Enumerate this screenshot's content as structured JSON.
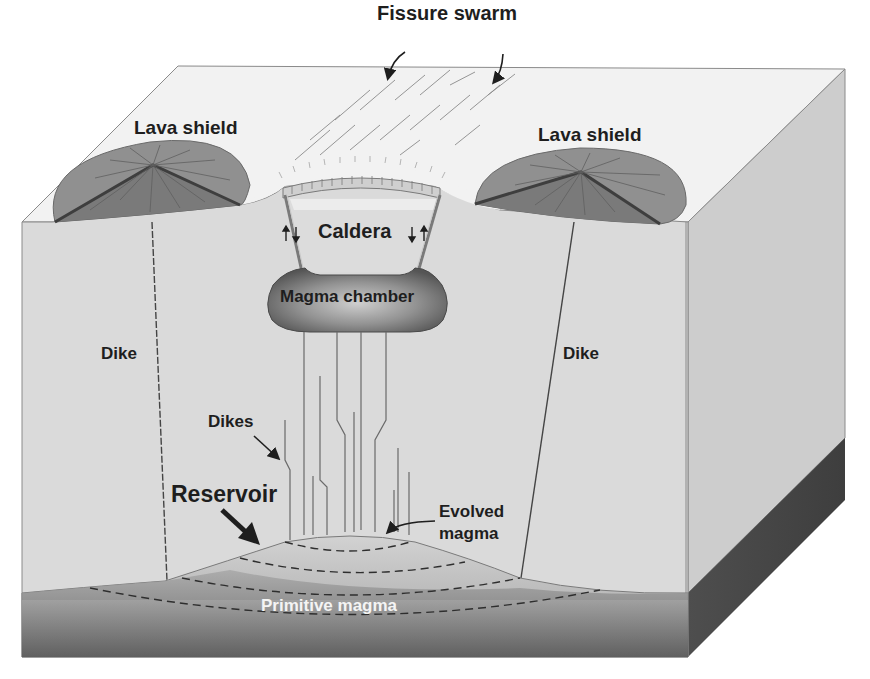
{
  "diagram": {
    "type": "block-diagram",
    "colors": {
      "top_face": "#f3f3f3",
      "front_face": "#dadada",
      "right_face": "#c9c9c9",
      "lava_shield": "#8e8e8e",
      "lava_shield_dark": "#6e6e6e",
      "magma_chamber_outer": "#5a5a5a",
      "magma_chamber_inner": "#c2c2c2",
      "reservoir": "#bdbdbd",
      "primitive_magma_top": "#9a9a9a",
      "primitive_magma_bottom": "#5e5e5e",
      "right_base_side": "#4a4a4a",
      "line": "#555555",
      "text": "#1e1e1e"
    },
    "labels": {
      "fissure_swarm": "Fissure swarm",
      "lava_shield_left": "Lava shield",
      "lava_shield_right": "Lava shield",
      "caldera": "Caldera",
      "magma_chamber": "Magma chamber",
      "dike_left": "Dike",
      "dike_right": "Dike",
      "dikes": "Dikes",
      "reservoir": "Reservoir",
      "evolved_magma_line1": "Evolved",
      "evolved_magma_line2": "magma",
      "primitive_magma": "Primitive magma"
    },
    "arrows": [
      {
        "from": "fissure_swarm",
        "to": "fissure lines (left)"
      },
      {
        "from": "fissure_swarm",
        "to": "fissure lines (right)"
      },
      {
        "from": "dikes",
        "to": "dike swarm"
      },
      {
        "from": "reservoir",
        "to": "reservoir top"
      },
      {
        "from": "evolved_magma",
        "to": "reservoir apex"
      }
    ],
    "caldera_motion_arrows": [
      "up-down left ring fault",
      "down-up right ring fault"
    ]
  }
}
